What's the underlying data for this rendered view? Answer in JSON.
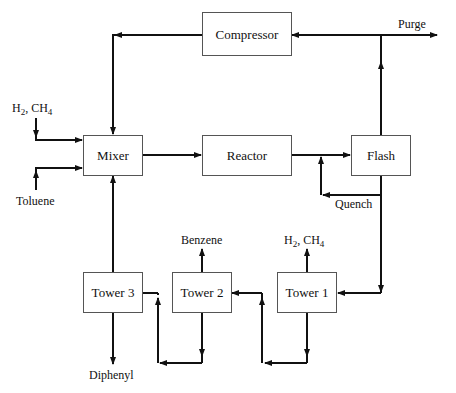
{
  "diagram": {
    "type": "process-flow",
    "units": {
      "compressor": "Compressor",
      "mixer": "Mixer",
      "reactor": "Reactor",
      "flash": "Flash",
      "tower3": "Tower 3",
      "tower2": "Tower 2",
      "tower1": "Tower 1"
    },
    "streams": {
      "feed_gas": {
        "h2": "H",
        "h2_sub": "2",
        "sep": ", CH",
        "ch4_sub": "4"
      },
      "toluene": "Toluene",
      "purge": "Purge",
      "quench": "Quench",
      "benzene": "Benzene",
      "light_gas": {
        "h2": "H",
        "h2_sub": "2",
        "sep": ", CH",
        "ch4_sub": "4"
      },
      "diphenyl": "Diphenyl"
    },
    "connections": [
      {
        "from": "H2, CH4 feed",
        "to": "Mixer"
      },
      {
        "from": "Toluene feed",
        "to": "Mixer"
      },
      {
        "from": "Compressor",
        "to": "Mixer"
      },
      {
        "from": "Tower 3",
        "to": "Mixer"
      },
      {
        "from": "Mixer",
        "to": "Reactor"
      },
      {
        "from": "Reactor",
        "to": "Flash"
      },
      {
        "from": "Flash",
        "to": "Compressor"
      },
      {
        "from": "Flash",
        "to": "Purge"
      },
      {
        "from": "Flash",
        "to": "Quench (Reactor outlet)"
      },
      {
        "from": "Flash",
        "to": "Tower 1"
      },
      {
        "from": "Tower 1",
        "to": "H2, CH4"
      },
      {
        "from": "Tower 1",
        "to": "Tower 2"
      },
      {
        "from": "Tower 2",
        "to": "Benzene"
      },
      {
        "from": "Tower 2",
        "to": "Tower 3"
      },
      {
        "from": "Tower 3",
        "to": "Diphenyl"
      }
    ],
    "colors": {
      "line": "#111111",
      "box_border": "#555555",
      "background": "#ffffff"
    }
  }
}
